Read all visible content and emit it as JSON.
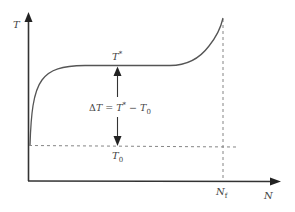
{
  "diagram": {
    "type": "schematic-curve",
    "colors": {
      "axis": "#333333",
      "curve": "#555555",
      "dashed": "#777777",
      "text": "#444444"
    },
    "axes": {
      "y_label": "T",
      "x_label": "N"
    },
    "labels": {
      "plateau": {
        "base": "T",
        "sup": "*"
      },
      "initial": {
        "base": "T",
        "sub": "0"
      },
      "failure": {
        "base": "N",
        "sub": "f"
      },
      "delta": {
        "prefix": "Δ",
        "var": "T",
        "eq": " = ",
        "rhs_base": "T",
        "rhs_sup": "*",
        "minus": " − ",
        "rhs2_base": "T",
        "rhs2_sub": "0"
      }
    },
    "annotations": {
      "delta_arrow": "double-headed vertical arrow between T0 and T*",
      "dashed_lines": [
        "horizontal at T0",
        "vertical at Nf"
      ]
    }
  }
}
